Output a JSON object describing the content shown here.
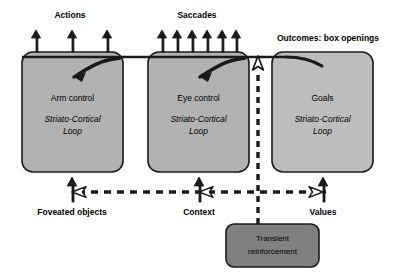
{
  "diagram": {
    "background_color": "#ffffff",
    "colors": {
      "box_fill_dark": "#b2b2b2",
      "box_fill_light": "#bdbdbd",
      "reinforcement_fill": "#808080",
      "stroke": "#1a1a1a",
      "text": "#000000"
    },
    "output_labels": [
      {
        "id": "actions",
        "text": "Actions",
        "x": 70,
        "y": 16,
        "arrow_count": 3
      },
      {
        "id": "saccades",
        "text": "Saccades",
        "x": 197,
        "y": 16,
        "arrow_count": 6
      },
      {
        "id": "outcomes",
        "text": "Outcomes: box openings",
        "x": 328,
        "y": 38,
        "arrow_count": 1
      }
    ],
    "modules": [
      {
        "id": "arm-control",
        "title": "Arm control",
        "subtitle_line1": "Striato-Cortical",
        "subtitle_line2": "Loop",
        "fill": "#b2b2b2",
        "x": 22,
        "y": 52,
        "width": 101,
        "height": 120
      },
      {
        "id": "eye-control",
        "title": "Eye control",
        "subtitle_line1": "Striato-Cortical",
        "subtitle_line2": "Loop",
        "fill": "#b2b2b2",
        "x": 148,
        "y": 52,
        "width": 101,
        "height": 120
      },
      {
        "id": "goals",
        "title": "Goals",
        "subtitle_line1": "Striato-Cortical",
        "subtitle_line2": "Loop",
        "fill": "#bdbdbd",
        "x": 272,
        "y": 52,
        "width": 101,
        "height": 120
      }
    ],
    "input_labels": [
      {
        "id": "foveated-objects",
        "text": "Foveated objects",
        "x": 72,
        "y": 213
      },
      {
        "id": "context",
        "text": "Context",
        "x": 199,
        "y": 213
      },
      {
        "id": "values",
        "text": "Values",
        "x": 323,
        "y": 213
      }
    ],
    "reinforcement_box": {
      "id": "transient-reinforcement",
      "line1": "Transient",
      "line2": "reinforcement",
      "fill": "#808080",
      "x": 226,
      "y": 224,
      "width": 93,
      "height": 43
    },
    "connections": {
      "top_bus_label": "top-feedback-bus",
      "dashed_bus_label": "lateral-dashed-bus",
      "vertical_dashed_label": "reinforcement-up-channel"
    }
  }
}
